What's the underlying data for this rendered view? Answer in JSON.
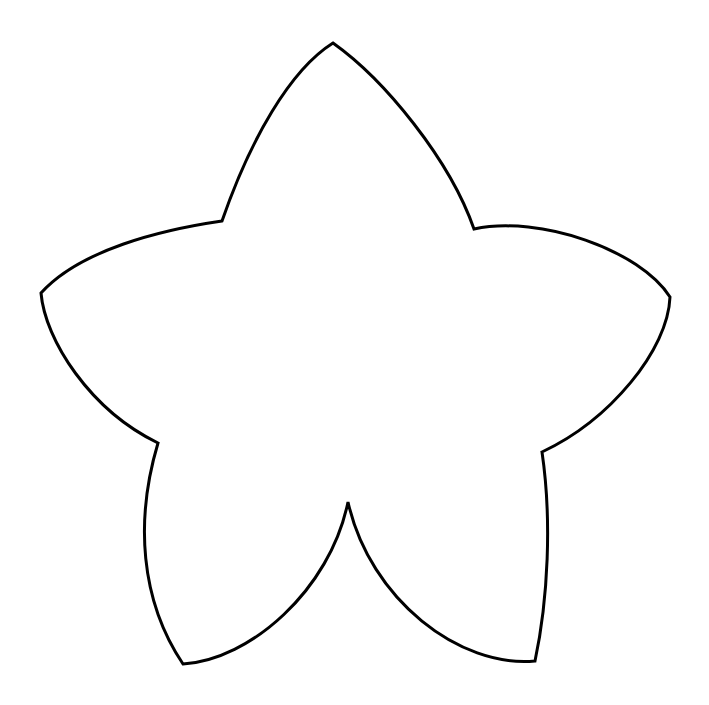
{
  "image": {
    "width": 709,
    "height": 705,
    "background": "#ffffff",
    "description": "Five-pointed star/flower outline drawing",
    "subject": "star-outline"
  },
  "shape": {
    "stroke_color": "#000000",
    "fill_color": "#ffffff",
    "stroke_width": 3,
    "tips": {
      "top": [
        333,
        43
      ],
      "right": [
        670,
        297
      ],
      "bottom_right": [
        535,
        661
      ],
      "bottom_left": [
        183,
        664
      ],
      "left": [
        41,
        293
      ]
    },
    "inner_corners": {
      "upper_left": [
        222,
        221
      ],
      "upper_right": [
        474,
        229
      ],
      "lower_right": [
        542,
        452
      ],
      "bottom": [
        348,
        502
      ],
      "lower_left": [
        158,
        443
      ]
    }
  }
}
